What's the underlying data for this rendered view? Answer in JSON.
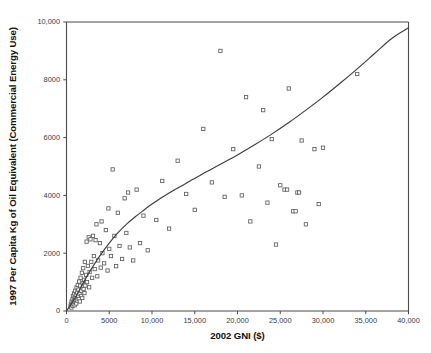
{
  "figure": {
    "background_color": "#ffffff",
    "marker_stroke_color": "#5d5d5d",
    "curve_color": "#3d3d3d",
    "axis_color": "#4a4a4a"
  },
  "chart_data": {
    "type": "scatter",
    "title": "",
    "xlabel": "2002 GNI ($)",
    "ylabel": "1997 Per Capita Kg of Oil Equivalent (Commercial Energy Use)",
    "xlim": [
      0,
      40000
    ],
    "ylim": [
      0,
      10000
    ],
    "grid": false,
    "legend": null,
    "xticks": [
      0,
      5000,
      10000,
      15000,
      20000,
      25000,
      30000,
      35000,
      40000
    ],
    "xticklabels": [
      "0",
      "5000",
      "10,000",
      "15,000",
      "20,000",
      "25,000",
      "30,000",
      "35,000",
      "40,000"
    ],
    "yticks": [
      0,
      2000,
      4000,
      6000,
      8000,
      10000
    ],
    "yticklabels": [
      "0",
      "2000",
      "4000",
      "6000",
      "8000",
      "10,000"
    ],
    "marker_style": "open-square",
    "points": [
      [
        480,
        160
      ],
      [
        520,
        240
      ],
      [
        560,
        120
      ],
      [
        600,
        330
      ],
      [
        640,
        210
      ],
      [
        700,
        400
      ],
      [
        720,
        180
      ],
      [
        760,
        520
      ],
      [
        800,
        300
      ],
      [
        830,
        250
      ],
      [
        860,
        430
      ],
      [
        900,
        610
      ],
      [
        930,
        340
      ],
      [
        960,
        200
      ],
      [
        990,
        470
      ],
      [
        1020,
        700
      ],
      [
        1060,
        380
      ],
      [
        1100,
        560
      ],
      [
        1140,
        260
      ],
      [
        1180,
        820
      ],
      [
        1200,
        430
      ],
      [
        1250,
        640
      ],
      [
        1280,
        360
      ],
      [
        1320,
        900
      ],
      [
        1360,
        510
      ],
      [
        1400,
        740
      ],
      [
        1440,
        420
      ],
      [
        1480,
        1020
      ],
      [
        1520,
        600
      ],
      [
        1560,
        330
      ],
      [
        1600,
        880
      ],
      [
        1650,
        1150
      ],
      [
        1700,
        520
      ],
      [
        1750,
        700
      ],
      [
        1800,
        1320
      ],
      [
        1850,
        450
      ],
      [
        1900,
        960
      ],
      [
        1950,
        1480
      ],
      [
        2000,
        760
      ],
      [
        2050,
        1080
      ],
      [
        2100,
        620
      ],
      [
        2150,
        1700
      ],
      [
        2200,
        880
      ],
      [
        2300,
        1250
      ],
      [
        2350,
        2400
      ],
      [
        2400,
        1000
      ],
      [
        2500,
        1560
      ],
      [
        2600,
        2550
      ],
      [
        2650,
        820
      ],
      [
        2700,
        1350
      ],
      [
        2800,
        2480
      ],
      [
        2900,
        1700
      ],
      [
        3000,
        1150
      ],
      [
        3100,
        2600
      ],
      [
        3200,
        1900
      ],
      [
        3300,
        1450
      ],
      [
        3400,
        2450
      ],
      [
        3500,
        3000
      ],
      [
        3600,
        1200
      ],
      [
        3700,
        1750
      ],
      [
        3900,
        2350
      ],
      [
        4000,
        1500
      ],
      [
        4100,
        3100
      ],
      [
        4200,
        2000
      ],
      [
        4400,
        1650
      ],
      [
        4600,
        2800
      ],
      [
        4800,
        1400
      ],
      [
        4900,
        3550
      ],
      [
        5000,
        2150
      ],
      [
        5200,
        1900
      ],
      [
        5400,
        4900
      ],
      [
        5600,
        2600
      ],
      [
        5800,
        1550
      ],
      [
        6000,
        3400
      ],
      [
        6200,
        2250
      ],
      [
        6500,
        1800
      ],
      [
        6800,
        3900
      ],
      [
        7000,
        2700
      ],
      [
        7200,
        4100
      ],
      [
        7400,
        2200
      ],
      [
        7800,
        1750
      ],
      [
        8200,
        4200
      ],
      [
        8600,
        2350
      ],
      [
        9000,
        3300
      ],
      [
        9500,
        2100
      ],
      [
        10500,
        3150
      ],
      [
        11200,
        4500
      ],
      [
        12000,
        2850
      ],
      [
        13000,
        5200
      ],
      [
        14000,
        4050
      ],
      [
        15000,
        3500
      ],
      [
        16000,
        6300
      ],
      [
        17000,
        4450
      ],
      [
        18000,
        9000
      ],
      [
        18500,
        3950
      ],
      [
        19500,
        5600
      ],
      [
        20500,
        4000
      ],
      [
        21000,
        7400
      ],
      [
        21500,
        3100
      ],
      [
        22500,
        5000
      ],
      [
        23000,
        6950
      ],
      [
        23500,
        3750
      ],
      [
        24000,
        5950
      ],
      [
        24500,
        2300
      ],
      [
        25000,
        4350
      ],
      [
        25500,
        4200
      ],
      [
        25800,
        4200
      ],
      [
        26000,
        7700
      ],
      [
        26500,
        3450
      ],
      [
        26800,
        3450
      ],
      [
        27000,
        4100
      ],
      [
        27200,
        4100
      ],
      [
        27500,
        5900
      ],
      [
        28000,
        3000
      ],
      [
        29000,
        5600
      ],
      [
        29500,
        3700
      ],
      [
        30000,
        5650
      ],
      [
        34000,
        8200
      ]
    ],
    "trend_curve": {
      "description": "fitted increasing curve",
      "points": [
        [
          0,
          0
        ],
        [
          1000,
          450
        ],
        [
          2000,
          1000
        ],
        [
          3000,
          1500
        ],
        [
          4000,
          1950
        ],
        [
          5000,
          2350
        ],
        [
          6000,
          2700
        ],
        [
          7000,
          3000
        ],
        [
          8000,
          3250
        ],
        [
          9000,
          3480
        ],
        [
          10000,
          3700
        ],
        [
          12000,
          4080
        ],
        [
          14000,
          4420
        ],
        [
          16000,
          4760
        ],
        [
          18000,
          5080
        ],
        [
          20000,
          5400
        ],
        [
          22000,
          5750
        ],
        [
          24000,
          6120
        ],
        [
          26000,
          6520
        ],
        [
          28000,
          6950
        ],
        [
          30000,
          7400
        ],
        [
          32000,
          7880
        ],
        [
          34000,
          8380
        ],
        [
          36000,
          8900
        ],
        [
          38000,
          9420
        ],
        [
          40000,
          9800
        ]
      ]
    }
  }
}
